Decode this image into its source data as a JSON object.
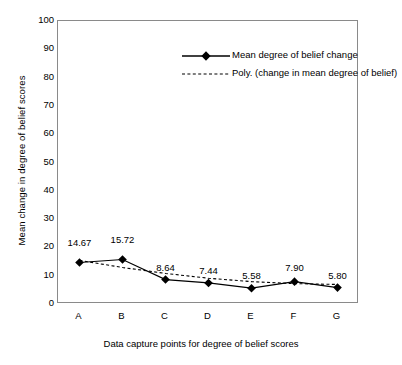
{
  "chart_data": {
    "type": "line",
    "title": "",
    "xlabel": "Data capture points for degree of belief scores",
    "ylabel": "Mean change in degree of belief scores",
    "categories": [
      "A",
      "B",
      "C",
      "D",
      "E",
      "F",
      "G"
    ],
    "ylim": [
      0,
      100
    ],
    "yticks": [
      0,
      10,
      20,
      30,
      40,
      50,
      60,
      70,
      80,
      90,
      100
    ],
    "grid": false,
    "legend_position": "inside-top-center",
    "series": [
      {
        "name": "Mean degree of belief change",
        "style": "solid-line-diamond-markers",
        "color": "#000000",
        "values": [
          14.67,
          15.72,
          8.64,
          7.44,
          5.58,
          7.9,
          5.8
        ],
        "data_labels": [
          "14.67",
          "15.72",
          "8.64",
          "7.44",
          "5.58",
          "7.90",
          "5.80"
        ]
      },
      {
        "name": "Poly. (change in mean degree of belief)",
        "style": "dotted-trendline",
        "color": "#000000",
        "values": [
          15.4,
          12.9,
          10.8,
          9.1,
          7.9,
          7.2,
          6.9
        ]
      }
    ],
    "annotations": []
  },
  "legend": {
    "entries": [
      {
        "label": "Mean degree of belief change",
        "key": "solid-diamond-key"
      },
      {
        "label": "Poly. (change in mean degree of belief)",
        "key": "dotted-line-key"
      }
    ]
  },
  "axes": {
    "y_tick_labels": [
      "100",
      "90",
      "80",
      "70",
      "60",
      "50",
      "40",
      "30",
      "20",
      "10",
      "0"
    ],
    "x_tick_labels": [
      "A",
      "B",
      "C",
      "D",
      "E",
      "F",
      "G"
    ],
    "y_axis_title": "Mean change in degree of belief scores",
    "x_axis_title": "Data capture points for degree of belief scores"
  },
  "colors": {
    "series_line": "#000000",
    "trendline": "#000000",
    "axis": "#8a8a8a",
    "background": "#ffffff",
    "text": "#000000"
  }
}
